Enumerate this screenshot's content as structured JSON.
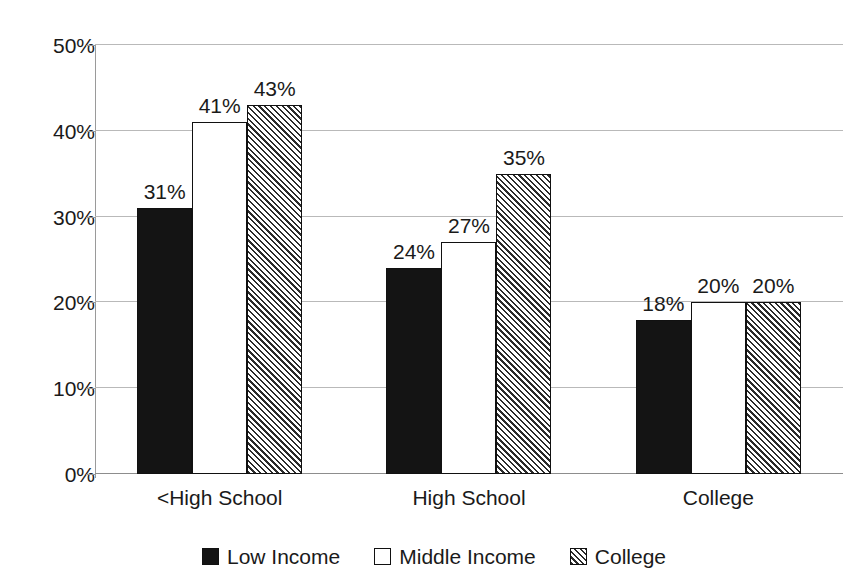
{
  "chart_data": {
    "type": "bar",
    "title": "",
    "subtitle": "",
    "xlabel": "",
    "ylabel": "",
    "categories": [
      "<High School",
      "High School",
      "College"
    ],
    "series": [
      {
        "name": "Low Income",
        "values": [
          31,
          24,
          18
        ],
        "fill": "solid-black",
        "color": "#141414"
      },
      {
        "name": "Middle Income",
        "values": [
          41,
          27,
          20
        ],
        "fill": "solid-white",
        "color": "#ffffff"
      },
      {
        "name": "College",
        "values": [
          43,
          35,
          20
        ],
        "fill": "diagonal-hatch",
        "color": "#808080"
      }
    ],
    "data_labels": [
      [
        "31%",
        "41%",
        "43%"
      ],
      [
        "24%",
        "27%",
        "35%"
      ],
      [
        "18%",
        "20%",
        "20%"
      ]
    ],
    "ylim": [
      0,
      50
    ],
    "ytick_values": [
      0,
      10,
      20,
      30,
      40,
      50
    ],
    "ytick_labels": [
      "0%",
      "10%",
      "20%",
      "30%",
      "40%",
      "50%"
    ],
    "grid": true,
    "grid_color": "#b9b9b9",
    "legend_position": "bottom-center",
    "background_color": "#ffffff",
    "axis_color": "#9a9a9a",
    "bar_outline_color": "#111111"
  },
  "legend": {
    "items": [
      {
        "label": "Low Income",
        "swatch": "legend-swatch-low-income"
      },
      {
        "label": "Middle Income",
        "swatch": "legend-swatch-middle-income"
      },
      {
        "label": "College",
        "swatch": "legend-swatch-college"
      }
    ]
  }
}
